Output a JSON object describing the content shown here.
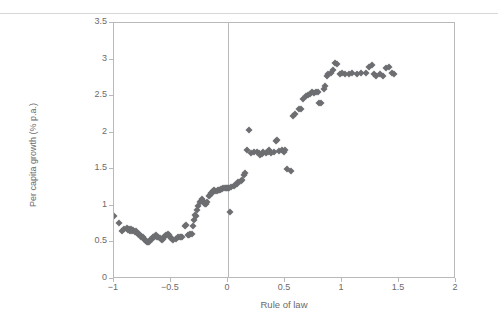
{
  "figure": {
    "background_color": "#ffffff",
    "frame_color": "#b9b9b9",
    "marker_color": "#6d6e71",
    "text_color": "#6a6a6c"
  },
  "chart_data": {
    "type": "scatter",
    "title": "",
    "xlabel": "Rule of law",
    "ylabel": "Per capita growth (% p.a.)",
    "xlim": [
      -1,
      2
    ],
    "ylim": [
      0,
      3.5
    ],
    "xticks": [
      -1,
      -0.5,
      0,
      0.5,
      1,
      1.5,
      2
    ],
    "xticklabels": [
      "−1",
      "−0.5",
      "0",
      "0.5",
      "1",
      "1.5",
      "2"
    ],
    "yticks": [
      0,
      0.5,
      1,
      1.5,
      2,
      2.5,
      3,
      3.5
    ],
    "yticklabels": [
      "0",
      "0.5",
      "1",
      "1.5",
      "2",
      "2.5",
      "3",
      "3.5"
    ],
    "grid": false,
    "legend": null,
    "annotations": [
      {
        "type": "vline",
        "x": 0,
        "label": "zero reference line"
      }
    ],
    "marker": "diamond",
    "series": [
      {
        "name": "Countries",
        "points": [
          [
            -1.0,
            0.86
          ],
          [
            -0.96,
            0.76
          ],
          [
            -0.93,
            0.66
          ],
          [
            -0.91,
            0.68
          ],
          [
            -0.89,
            0.7
          ],
          [
            -0.88,
            0.67
          ],
          [
            -0.87,
            0.69
          ],
          [
            -0.86,
            0.66
          ],
          [
            -0.85,
            0.68
          ],
          [
            -0.84,
            0.65
          ],
          [
            -0.83,
            0.67
          ],
          [
            -0.82,
            0.64
          ],
          [
            -0.81,
            0.66
          ],
          [
            -0.8,
            0.63
          ],
          [
            -0.79,
            0.62
          ],
          [
            -0.78,
            0.61
          ],
          [
            -0.77,
            0.6
          ],
          [
            -0.76,
            0.58
          ],
          [
            -0.75,
            0.57
          ],
          [
            -0.74,
            0.55
          ],
          [
            -0.73,
            0.54
          ],
          [
            -0.72,
            0.52
          ],
          [
            -0.71,
            0.51
          ],
          [
            -0.7,
            0.5
          ],
          [
            -0.69,
            0.51
          ],
          [
            -0.68,
            0.53
          ],
          [
            -0.67,
            0.55
          ],
          [
            -0.66,
            0.57
          ],
          [
            -0.65,
            0.58
          ],
          [
            -0.64,
            0.59
          ],
          [
            -0.63,
            0.6
          ],
          [
            -0.62,
            0.58
          ],
          [
            -0.61,
            0.57
          ],
          [
            -0.6,
            0.56
          ],
          [
            -0.59,
            0.55
          ],
          [
            -0.58,
            0.54
          ],
          [
            -0.57,
            0.55
          ],
          [
            -0.56,
            0.57
          ],
          [
            -0.55,
            0.59
          ],
          [
            -0.54,
            0.6
          ],
          [
            -0.53,
            0.61
          ],
          [
            -0.52,
            0.6
          ],
          [
            -0.51,
            0.58
          ],
          [
            -0.5,
            0.56
          ],
          [
            -0.49,
            0.55
          ],
          [
            -0.48,
            0.54
          ],
          [
            -0.46,
            0.55
          ],
          [
            -0.44,
            0.57
          ],
          [
            -0.42,
            0.57
          ],
          [
            -0.41,
            0.58
          ],
          [
            -0.4,
            0.58
          ],
          [
            -0.38,
            0.72
          ],
          [
            -0.37,
            0.74
          ],
          [
            -0.35,
            0.6
          ],
          [
            -0.34,
            0.6
          ],
          [
            -0.33,
            0.61
          ],
          [
            -0.32,
            0.62
          ],
          [
            -0.31,
            0.72
          ],
          [
            -0.3,
            0.8
          ],
          [
            -0.29,
            0.88
          ],
          [
            -0.28,
            0.86
          ],
          [
            -0.27,
            0.95
          ],
          [
            -0.26,
            1.0
          ],
          [
            -0.25,
            1.05
          ],
          [
            -0.24,
            1.07
          ],
          [
            -0.23,
            1.09
          ],
          [
            -0.22,
            1.06
          ],
          [
            -0.21,
            1.04
          ],
          [
            -0.2,
            1.02
          ],
          [
            -0.19,
            1.03
          ],
          [
            -0.18,
            1.05
          ],
          [
            -0.17,
            1.13
          ],
          [
            -0.16,
            1.15
          ],
          [
            -0.15,
            1.17
          ],
          [
            -0.14,
            1.18
          ],
          [
            -0.13,
            1.2
          ],
          [
            -0.12,
            1.21
          ],
          [
            -0.11,
            1.2
          ],
          [
            -0.1,
            1.2
          ],
          [
            -0.09,
            1.21
          ],
          [
            -0.08,
            1.22
          ],
          [
            -0.07,
            1.22
          ],
          [
            -0.06,
            1.23
          ],
          [
            -0.05,
            1.23
          ],
          [
            -0.04,
            1.24
          ],
          [
            -0.03,
            1.24
          ],
          [
            -0.02,
            1.25
          ],
          [
            -0.01,
            1.25
          ],
          [
            0.0,
            1.25
          ],
          [
            0.01,
            1.25
          ],
          [
            0.02,
            0.92
          ],
          [
            0.03,
            1.26
          ],
          [
            0.05,
            1.27
          ],
          [
            0.06,
            1.28
          ],
          [
            0.08,
            1.3
          ],
          [
            0.09,
            1.32
          ],
          [
            0.11,
            1.34
          ],
          [
            0.12,
            1.36
          ],
          [
            0.14,
            1.42
          ],
          [
            0.15,
            1.45
          ],
          [
            0.17,
            1.76
          ],
          [
            0.18,
            2.04
          ],
          [
            0.2,
            1.72
          ],
          [
            0.23,
            1.73
          ],
          [
            0.25,
            1.74
          ],
          [
            0.27,
            1.72
          ],
          [
            0.28,
            1.7
          ],
          [
            0.3,
            1.71
          ],
          [
            0.31,
            1.73
          ],
          [
            0.33,
            1.72
          ],
          [
            0.35,
            1.74
          ],
          [
            0.36,
            1.76
          ],
          [
            0.38,
            1.72
          ],
          [
            0.4,
            1.74
          ],
          [
            0.42,
            1.88
          ],
          [
            0.43,
            1.9
          ],
          [
            0.45,
            1.75
          ],
          [
            0.47,
            1.77
          ],
          [
            0.49,
            1.74
          ],
          [
            0.5,
            1.76
          ],
          [
            0.52,
            1.5
          ],
          [
            0.55,
            1.47
          ],
          [
            0.57,
            2.23
          ],
          [
            0.59,
            2.25
          ],
          [
            0.62,
            2.32
          ],
          [
            0.64,
            2.33
          ],
          [
            0.66,
            2.46
          ],
          [
            0.68,
            2.5
          ],
          [
            0.7,
            2.52
          ],
          [
            0.72,
            2.53
          ],
          [
            0.74,
            2.55
          ],
          [
            0.75,
            2.54
          ],
          [
            0.77,
            2.55
          ],
          [
            0.79,
            2.56
          ],
          [
            0.8,
            2.4
          ],
          [
            0.82,
            2.41
          ],
          [
            0.84,
            2.6
          ],
          [
            0.85,
            2.64
          ],
          [
            0.87,
            2.77
          ],
          [
            0.88,
            2.8
          ],
          [
            0.9,
            2.82
          ],
          [
            0.92,
            2.86
          ],
          [
            0.94,
            2.95
          ],
          [
            0.96,
            2.94
          ],
          [
            0.98,
            2.8
          ],
          [
            1.0,
            2.81
          ],
          [
            1.03,
            2.8
          ],
          [
            1.06,
            2.8
          ],
          [
            1.09,
            2.81
          ],
          [
            1.13,
            2.8
          ],
          [
            1.17,
            2.82
          ],
          [
            1.21,
            2.81
          ],
          [
            1.24,
            2.9
          ],
          [
            1.26,
            2.92
          ],
          [
            1.28,
            2.8
          ],
          [
            1.3,
            2.78
          ],
          [
            1.33,
            2.8
          ],
          [
            1.36,
            2.78
          ],
          [
            1.39,
            2.88
          ],
          [
            1.41,
            2.9
          ],
          [
            1.44,
            2.82
          ],
          [
            1.46,
            2.8
          ]
        ]
      }
    ]
  }
}
